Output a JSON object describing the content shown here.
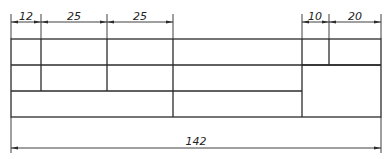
{
  "drawing": {
    "type": "title-block-layout",
    "top_dimensions": [
      {
        "label": "12",
        "x1": 11,
        "x2": 41
      },
      {
        "label": "25",
        "x1": 41,
        "x2": 107
      },
      {
        "label": "25",
        "x1": 107,
        "x2": 173
      },
      {
        "label": "10",
        "x1": 302,
        "x2": 329
      },
      {
        "label": "20",
        "x1": 329,
        "x2": 381
      }
    ],
    "bottom_dimension": {
      "label": "142",
      "x1": 11,
      "x2": 381
    },
    "colors": {
      "line": "#2b2b2b",
      "background": "#ffffff"
    }
  }
}
